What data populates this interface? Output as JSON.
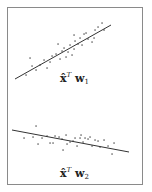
{
  "panels": [
    {
      "id": "top",
      "label": {
        "vector": "x̂",
        "transpose": "T",
        "weight": "w",
        "index": "1"
      },
      "line": {
        "x1": 15,
        "y1": 79,
        "x2": 111,
        "y2": 25
      },
      "points": [
        [
          30,
          58
        ],
        [
          36,
          70
        ],
        [
          40,
          65
        ],
        [
          44,
          60
        ],
        [
          47,
          68
        ],
        [
          50,
          62
        ],
        [
          52,
          56
        ],
        [
          56,
          54
        ],
        [
          58,
          44
        ],
        [
          60,
          59
        ],
        [
          62,
          51
        ],
        [
          64,
          48
        ],
        [
          66,
          57
        ],
        [
          68,
          52
        ],
        [
          70,
          45
        ],
        [
          72,
          55
        ],
        [
          74,
          49
        ],
        [
          75,
          41
        ],
        [
          74,
          35
        ],
        [
          78,
          44
        ],
        [
          80,
          38
        ],
        [
          82,
          45
        ],
        [
          84,
          34
        ],
        [
          86,
          33
        ],
        [
          88,
          39
        ],
        [
          92,
          42
        ],
        [
          94,
          38
        ],
        [
          95,
          30
        ],
        [
          98,
          27
        ],
        [
          102,
          23
        ],
        [
          104,
          30
        ],
        [
          26,
          75
        ],
        [
          32,
          66
        ]
      ]
    },
    {
      "id": "bottom",
      "label": {
        "vector": "x̂",
        "transpose": "T",
        "weight": "w",
        "index": "2"
      },
      "line": {
        "x1": 12,
        "y1": 130,
        "x2": 129,
        "y2": 152
      },
      "points": [
        [
          24,
          138
        ],
        [
          33,
          137
        ],
        [
          36,
          126
        ],
        [
          38,
          144
        ],
        [
          42,
          138
        ],
        [
          47,
          136
        ],
        [
          50,
          143
        ],
        [
          53,
          143
        ],
        [
          55,
          136
        ],
        [
          59,
          137
        ],
        [
          62,
          139
        ],
        [
          63,
          150
        ],
        [
          66,
          135
        ],
        [
          67,
          144
        ],
        [
          70,
          142
        ],
        [
          73,
          141
        ],
        [
          75,
          138
        ],
        [
          77,
          146
        ],
        [
          80,
          138
        ],
        [
          81,
          135
        ],
        [
          83,
          142
        ],
        [
          85,
          138
        ],
        [
          88,
          139
        ],
        [
          90,
          137
        ],
        [
          92,
          146
        ],
        [
          95,
          140
        ],
        [
          98,
          141
        ],
        [
          100,
          147
        ],
        [
          104,
          140
        ],
        [
          108,
          146
        ],
        [
          112,
          154
        ],
        [
          114,
          143
        ]
      ]
    }
  ],
  "colors": {
    "frame": "#8a8a8a",
    "line": "#333333",
    "point": "#444444",
    "text": "#222222"
  }
}
